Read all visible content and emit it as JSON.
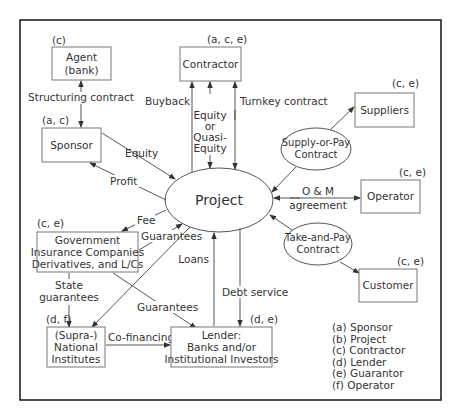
{
  "diagram": {
    "center": {
      "label": "Project"
    },
    "nodes": {
      "agent": {
        "label_line1": "Agent",
        "label_line2": "(bank)",
        "roles": "(c)"
      },
      "contractor": {
        "label": "Contractor",
        "roles": "(a, c, e)"
      },
      "sponsor": {
        "label": "Sponsor",
        "roles": "(a, c)"
      },
      "suppliers": {
        "label": "Suppliers",
        "roles": "(c, e)"
      },
      "operator": {
        "label": "Operator",
        "roles": "(c, e)"
      },
      "customer": {
        "label": "Customer",
        "roles": "(c, e)"
      },
      "government": {
        "label_line1": "Government",
        "label_line2": "Insurance Companies",
        "label_line3": "Derivatives, and L/Cs",
        "roles": "(c, e)"
      },
      "supranational": {
        "label_line1": "(Supra-)",
        "label_line2": "National",
        "label_line3": "Institutes",
        "roles": "(d, f)"
      },
      "lender": {
        "label_line1": "Lender:",
        "label_line2": "Banks and/or",
        "label_line3": "Institutional Investors",
        "roles": "(d, e)"
      }
    },
    "contracts": {
      "supply_or_pay": {
        "line1": "Supply-or-Pay",
        "line2": "Contract"
      },
      "take_and_pay": {
        "line1": "Take-and-Pay",
        "line2": "Contract"
      }
    },
    "edges": {
      "structuring_contract": "Structuring contract",
      "buyback": "Buyback",
      "equity_quasi": {
        "line1": "Equity",
        "line2": "or",
        "line3": "Quasi-",
        "line4": "Equity"
      },
      "turnkey": "Turnkey contract",
      "equity": "Equity",
      "profit": "Profit",
      "om": {
        "line1": "O & M",
        "line2": "agreement"
      },
      "fee": "Fee",
      "guarantees_gov": "Guarantees",
      "loans": "Loans",
      "debt_service": "Debt service",
      "state_guarantees": {
        "line1": "State",
        "line2": "guarantees"
      },
      "guarantees_lender": "Guarantees",
      "co_financing": "Co-financing"
    },
    "legend": [
      "(a) Sponsor",
      "(b) Project",
      "(c) Contractor",
      "(d) Lender",
      "(e) Guarantor",
      "(f) Operator"
    ]
  }
}
